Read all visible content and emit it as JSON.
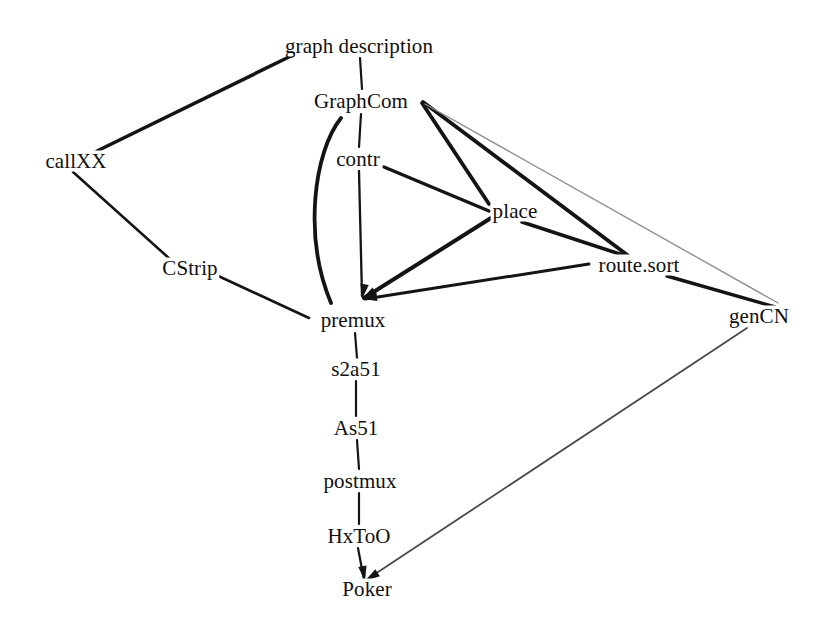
{
  "diagram": {
    "type": "directed-graph",
    "width": 838,
    "height": 631,
    "background_color": "#ffffff",
    "edge_color": "#141414",
    "faint_edge_color": "#9a9a9a",
    "label_color": "#101010",
    "nodes": [
      {
        "id": "graph_description",
        "label": "graph description",
        "x": 359,
        "y": 46
      },
      {
        "id": "graphcom",
        "label": "GraphCom",
        "x": 361,
        "y": 101
      },
      {
        "id": "callxx",
        "label": "callXX",
        "x": 76,
        "y": 161
      },
      {
        "id": "contr",
        "label": "contr",
        "x": 358,
        "y": 159
      },
      {
        "id": "place",
        "label": "place",
        "x": 515,
        "y": 211
      },
      {
        "id": "cstrip",
        "label": "CStrip",
        "x": 190,
        "y": 268
      },
      {
        "id": "route_sort",
        "label": "route.sort",
        "x": 639,
        "y": 265
      },
      {
        "id": "gencn",
        "label": "genCN",
        "x": 759,
        "y": 316
      },
      {
        "id": "premux",
        "label": "premux",
        "x": 353,
        "y": 320
      },
      {
        "id": "s2a51",
        "label": "s2a51",
        "x": 356,
        "y": 369
      },
      {
        "id": "as51",
        "label": "As51",
        "x": 356,
        "y": 428
      },
      {
        "id": "postmux",
        "label": "postmux",
        "x": 360,
        "y": 481
      },
      {
        "id": "hxtoo",
        "label": "HxToO",
        "x": 359,
        "y": 536
      },
      {
        "id": "poker",
        "label": "Poker",
        "x": 367,
        "y": 589
      }
    ],
    "edges": [
      {
        "id": "e-gd-callxx",
        "from": "graph_description",
        "to": "callxx",
        "style": "straight",
        "weight": "thick"
      },
      {
        "id": "e-gd-graphcom",
        "from": "graph_description",
        "to": "graphcom",
        "style": "straight",
        "weight": "thin"
      },
      {
        "id": "e-graphcom-contr",
        "from": "graphcom",
        "to": "contr",
        "style": "straight",
        "weight": "thin"
      },
      {
        "id": "e-graphcom-premux",
        "from": "graphcom",
        "to": "premux",
        "style": "curved",
        "weight": "thick"
      },
      {
        "id": "e-graphcom-place",
        "from": "graphcom",
        "to": "place",
        "style": "straight",
        "weight": "thick"
      },
      {
        "id": "e-graphcom-route",
        "from": "graphcom",
        "to": "route_sort",
        "style": "straight",
        "weight": "thick"
      },
      {
        "id": "e-graphcom-gencn",
        "from": "graphcom",
        "to": "gencn",
        "style": "straight",
        "weight": "faint"
      },
      {
        "id": "e-callxx-cstrip",
        "from": "callxx",
        "to": "cstrip",
        "style": "straight",
        "weight": "thick"
      },
      {
        "id": "e-cstrip-premux",
        "from": "cstrip",
        "to": "premux",
        "style": "straight",
        "weight": "thick"
      },
      {
        "id": "e-contr-place",
        "from": "contr",
        "to": "place",
        "style": "straight",
        "weight": "thick"
      },
      {
        "id": "e-contr-premux",
        "from": "contr",
        "to": "premux",
        "style": "straight",
        "weight": "thin"
      },
      {
        "id": "e-place-premux",
        "from": "place",
        "to": "premux",
        "style": "straight",
        "weight": "thick"
      },
      {
        "id": "e-place-route",
        "from": "place",
        "to": "route_sort",
        "style": "straight",
        "weight": "thick"
      },
      {
        "id": "e-route-premux",
        "from": "route_sort",
        "to": "premux",
        "style": "straight",
        "weight": "thick"
      },
      {
        "id": "e-route-gencn",
        "from": "route_sort",
        "to": "gencn",
        "style": "straight",
        "weight": "thick"
      },
      {
        "id": "e-premux-s2a51",
        "from": "premux",
        "to": "s2a51",
        "style": "straight",
        "weight": "thin"
      },
      {
        "id": "e-s2a51-as51",
        "from": "s2a51",
        "to": "as51",
        "style": "straight",
        "weight": "thin"
      },
      {
        "id": "e-as51-postmux",
        "from": "as51",
        "to": "postmux",
        "style": "straight",
        "weight": "thin"
      },
      {
        "id": "e-postmux-hxtoo",
        "from": "postmux",
        "to": "hxtoo",
        "style": "straight",
        "weight": "thin"
      },
      {
        "id": "e-hxtoo-poker",
        "from": "hxtoo",
        "to": "poker",
        "style": "straight",
        "weight": "thin"
      },
      {
        "id": "e-gencn-poker",
        "from": "gencn",
        "to": "poker",
        "style": "straight",
        "weight": "faint"
      }
    ],
    "edge_paths": [
      {
        "id": "e-gd-callxx",
        "d": "M 291 56 L 97 151",
        "w": 3.6,
        "color": "#141414"
      },
      {
        "id": "e-gd-graphcom",
        "d": "M 360 58 L 362 89",
        "w": 2.2,
        "color": "#141414"
      },
      {
        "id": "e-graphcom-contr",
        "d": "M 361 114 L 359 147",
        "w": 2.2,
        "color": "#141414"
      },
      {
        "id": "e-graphcom-premux",
        "d": "M 341 118 C 314 152, 303 236, 331 303",
        "w": 3.8,
        "color": "#141414"
      },
      {
        "id": "e-graphcom-place",
        "d": "M 422 103 L 489 204",
        "w": 3.8,
        "color": "#141414"
      },
      {
        "id": "e-graphcom-route",
        "d": "M 423 102 L 630 257",
        "w": 3.8,
        "color": "#141414"
      },
      {
        "id": "e-graphcom-gencn",
        "d": "M 425 104 L 778 303",
        "w": 1.4,
        "color": "#8f8f8f"
      },
      {
        "id": "e-callxx-cstrip",
        "d": "M 73 172 L 171 260",
        "w": 2.6,
        "color": "#141414"
      },
      {
        "id": "e-cstrip-premux",
        "d": "M 214 274 L 309 318",
        "w": 2.6,
        "color": "#141414"
      },
      {
        "id": "e-contr-place",
        "d": "M 384 167 L 489 211",
        "w": 3.4,
        "color": "#141414"
      },
      {
        "id": "e-contr-premux",
        "d": "M 359 171 L 362 296",
        "w": 2.3,
        "color": "#141414"
      },
      {
        "id": "e-place-premux",
        "d": "M 491 218 L 364 298",
        "w": 4.0,
        "color": "#141414"
      },
      {
        "id": "e-place-route",
        "d": "M 522 222 L 632 258",
        "w": 3.6,
        "color": "#141414"
      },
      {
        "id": "e-route-premux",
        "d": "M 589 264 L 365 299",
        "w": 3.0,
        "color": "#141414"
      },
      {
        "id": "e-route-gencn",
        "d": "M 667 276 L 775 307",
        "w": 3.4,
        "color": "#141414"
      },
      {
        "id": "e-premux-s2a51",
        "d": "M 355 333 L 357 358",
        "w": 2.2,
        "color": "#141414"
      },
      {
        "id": "e-s2a51-as51",
        "d": "M 356 381 L 356 416",
        "w": 2.2,
        "color": "#141414"
      },
      {
        "id": "e-as51-postmux",
        "d": "M 357 440 L 359 469",
        "w": 2.2,
        "color": "#141414"
      },
      {
        "id": "e-postmux-hxtoo",
        "d": "M 359 493 L 359 524",
        "w": 2.2,
        "color": "#141414"
      },
      {
        "id": "e-hxtoo-poker",
        "d": "M 358 548 L 364 580",
        "w": 2.2,
        "color": "#141414"
      },
      {
        "id": "e-gencn-poker",
        "d": "M 747 328 L 366 580",
        "w": 1.8,
        "color": "#4a4a4a"
      }
    ],
    "arrow_heads": [
      {
        "id": "ah-premux-1",
        "x": 362,
        "y": 299,
        "angle": 100
      },
      {
        "id": "ah-premux-2",
        "x": 362,
        "y": 299,
        "angle": 148
      },
      {
        "id": "ah-premux-3",
        "x": 362,
        "y": 299,
        "angle": 172
      },
      {
        "id": "ah-poker",
        "x": 365,
        "y": 581,
        "angle": 80
      },
      {
        "id": "ah-poker-2",
        "x": 365,
        "y": 581,
        "angle": 147
      }
    ]
  }
}
